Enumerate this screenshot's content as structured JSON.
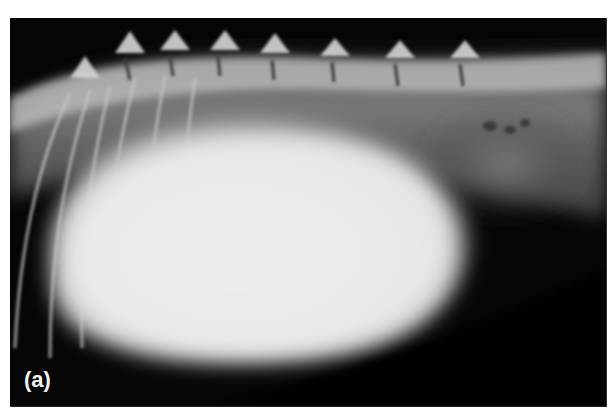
{
  "figure": {
    "label": "(a)",
    "colors": {
      "background": "#ffffff",
      "film_dark": "#060606",
      "mass_bright": "#ededed",
      "bone": "#cfcfcf"
    }
  }
}
